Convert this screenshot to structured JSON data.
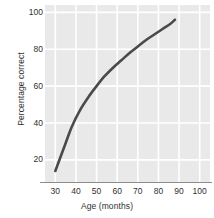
{
  "chart_data": {
    "type": "line",
    "title": "",
    "subtitle": "",
    "xlabel": "Age (months)",
    "ylabel": "Percentage correct",
    "xlim": [
      25,
      105
    ],
    "ylim": [
      8,
      104
    ],
    "xticks": [
      30,
      40,
      50,
      60,
      70,
      80,
      90,
      100
    ],
    "xtick_labels": [
      "30",
      "40",
      "50",
      "60",
      "70",
      "80",
      "90",
      "100"
    ],
    "yticks": [
      20,
      40,
      60,
      80,
      100
    ],
    "ytick_labels": [
      "20",
      "40",
      "60",
      "80",
      "100"
    ],
    "grid": true,
    "grid_color": "#ffffff",
    "plot_background": "#e9e9e9",
    "legend": null,
    "legend_position": "none",
    "series": [
      {
        "name": "Percentage correct",
        "color": "#4a4a4a",
        "line_width": 2.6,
        "marker": "none",
        "x": [
          30,
          34,
          38,
          42,
          46,
          50,
          54,
          58,
          62,
          66,
          70,
          74,
          78,
          82,
          86,
          88
        ],
        "y": [
          14,
          26,
          38,
          47,
          54,
          60,
          65.5,
          70,
          74,
          78,
          81.5,
          85,
          88,
          91,
          94,
          96
        ]
      }
    ],
    "annotations": []
  },
  "figure": {
    "axis_line_color": "#8c8c8c",
    "tick_text_color": "#303030",
    "canvas_background": "#ffffff"
  }
}
